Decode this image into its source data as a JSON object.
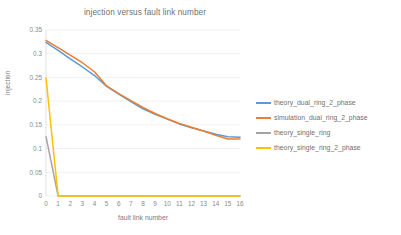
{
  "chart_data": {
    "type": "line",
    "title": "injection versus fault link number",
    "xlabel": "fault link number",
    "ylabel": "injection",
    "grid": true,
    "legend_position": "right",
    "xlim": [
      0,
      16
    ],
    "ylim": [
      0,
      0.35
    ],
    "x": [
      0,
      1,
      2,
      3,
      4,
      5,
      6,
      7,
      8,
      9,
      10,
      11,
      12,
      13,
      14,
      15,
      16
    ],
    "xticks": [
      "0",
      "1",
      "2",
      "3",
      "4",
      "5",
      "6",
      "7",
      "8",
      "9",
      "10",
      "11",
      "12",
      "13",
      "14",
      "15",
      "16"
    ],
    "yticks": [
      "0",
      "0.05",
      "0.1",
      "0.15",
      "0.2",
      "0.25",
      "0.3",
      "0.35"
    ],
    "ytick_values": [
      0,
      0.05,
      0.1,
      0.15,
      0.2,
      0.25,
      0.3,
      0.35
    ],
    "series": [
      {
        "name": "theory_dual_ring_2_phase",
        "color": "#5b9bd5",
        "values": [
          0.324,
          0.307,
          0.289,
          0.272,
          0.254,
          0.231,
          0.215,
          0.199,
          0.184,
          0.172,
          0.162,
          0.152,
          0.144,
          0.137,
          0.13,
          0.125,
          0.124
        ]
      },
      {
        "name": "simulation_dual_ring_2_phase",
        "color": "#ed7d31",
        "values": [
          0.328,
          0.313,
          0.297,
          0.281,
          0.262,
          0.232,
          0.216,
          0.201,
          0.187,
          0.174,
          0.163,
          0.153,
          0.145,
          0.137,
          0.128,
          0.12,
          0.12
        ]
      },
      {
        "name": "theory_single_ring",
        "color": "#a5a5a5",
        "values": [
          0.125,
          0,
          0,
          0,
          0,
          0,
          0,
          0,
          0,
          0,
          0,
          0,
          0,
          0,
          0,
          0,
          0
        ]
      },
      {
        "name": "theory_single_ring_2_phase",
        "color": "#ffc000",
        "values": [
          0.249,
          0,
          0,
          0,
          0,
          0,
          0,
          0,
          0,
          0,
          0,
          0,
          0,
          0,
          0,
          0,
          0
        ]
      }
    ]
  },
  "legend": {
    "items": [
      {
        "label": "theory_dual_ring_2_phase",
        "color": "#5b9bd5"
      },
      {
        "label": "simulation_dual_ring_2_phase",
        "color": "#ed7d31"
      },
      {
        "label": "theory_single_ring",
        "color": "#a5a5a5"
      },
      {
        "label": "theory_single_ring_2_phase",
        "color": "#ffc000"
      }
    ]
  }
}
